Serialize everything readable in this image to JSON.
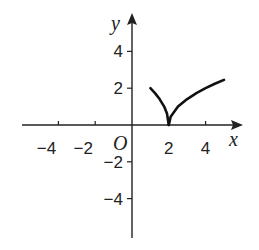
{
  "chart_data": {
    "type": "line",
    "title": "",
    "xlabel": "x",
    "ylabel": "y",
    "origin_label": "O",
    "xlim": [
      -6,
      6
    ],
    "ylim": [
      -6,
      6
    ],
    "grid": false,
    "x_ticks": [
      -4,
      -2,
      2,
      4
    ],
    "x_tick_labels": [
      "−4",
      "−2",
      "2",
      "4"
    ],
    "y_ticks": [
      4,
      2,
      -2,
      -4
    ],
    "y_tick_labels": [
      "4",
      "2",
      "−2",
      "−4"
    ],
    "series": [
      {
        "name": "left-branch",
        "x": [
          1.0,
          1.25,
          1.5,
          1.75,
          1.9,
          2.0
        ],
        "y": [
          2.0,
          1.73,
          1.41,
          1.0,
          0.63,
          0.0
        ]
      },
      {
        "name": "right-branch",
        "x": [
          2.0,
          2.1,
          2.5,
          3.0,
          3.5,
          4.0,
          4.5,
          5.0
        ],
        "y": [
          0.0,
          0.45,
          1.0,
          1.41,
          1.73,
          2.0,
          2.24,
          2.45
        ]
      }
    ],
    "color": "#111111"
  }
}
